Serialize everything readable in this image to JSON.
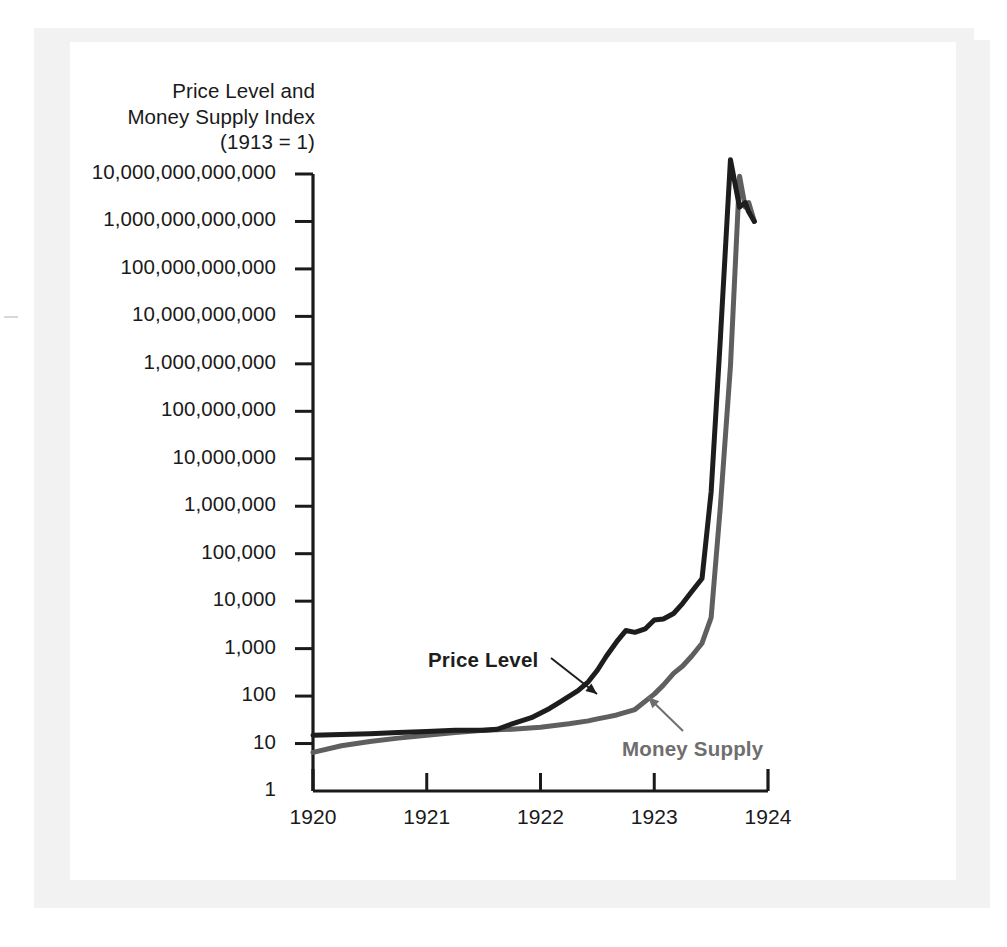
{
  "chart_data": {
    "type": "line",
    "title": "Price Level and Money Supply Index (1913 = 1)",
    "title_lines": [
      "Price Level and",
      "Money Supply Index",
      "(1913 = 1)"
    ],
    "xlabel": "",
    "ylabel": "Price Level and Money Supply Index (1913 = 1)",
    "y_scale": "log",
    "ylim": [
      1,
      10000000000000
    ],
    "xlim": [
      1920,
      1924
    ],
    "grid": false,
    "legend_position": "inline-annotations",
    "ytick_labels": [
      "10,000,000,000,000",
      "1,000,000,000,000",
      "100,000,000,000",
      "10,000,000,000",
      "1,000,000,000",
      "100,000,000",
      "10,000,000",
      "1,000,000",
      "100,000",
      "10,000",
      "1,000",
      "100",
      "10",
      "1"
    ],
    "ytick_values": [
      10000000000000,
      1000000000000,
      100000000000,
      10000000000,
      1000000000,
      100000000,
      10000000,
      1000000,
      100000,
      10000,
      1000,
      100,
      10,
      1
    ],
    "xtick_labels": [
      "1920",
      "1921",
      "1922",
      "1923",
      "1924"
    ],
    "xtick_values": [
      1920,
      1921,
      1922,
      1923,
      1924
    ],
    "series": [
      {
        "name": "Price Level",
        "color": "#1d1d1d",
        "x": [
          1920.0,
          1920.25,
          1920.5,
          1920.75,
          1921.0,
          1921.25,
          1921.5,
          1921.62,
          1921.75,
          1921.92,
          1922.08,
          1922.17,
          1922.33,
          1922.42,
          1922.5,
          1922.58,
          1922.67,
          1922.75,
          1922.83,
          1922.92,
          1923.0,
          1923.08,
          1923.17,
          1923.25,
          1923.33,
          1923.42,
          1923.5,
          1923.58,
          1923.67,
          1923.75,
          1923.8,
          1923.83,
          1923.88
        ],
        "y": [
          15,
          15.5,
          16,
          17,
          18,
          19,
          19,
          20,
          26,
          35,
          55,
          75,
          130,
          200,
          350,
          700,
          1400,
          2400,
          2200,
          2600,
          4000,
          4200,
          5500,
          9000,
          16000,
          30000,
          2000000,
          3000000000,
          20000000000000,
          2000000000000,
          2500000000000,
          1600000000000,
          1000000000000
        ]
      },
      {
        "name": "Money Supply",
        "color": "#5f5f5f",
        "x": [
          1920.0,
          1920.25,
          1920.5,
          1920.75,
          1921.0,
          1921.25,
          1921.5,
          1921.75,
          1922.0,
          1922.25,
          1922.42,
          1922.5,
          1922.58,
          1922.67,
          1922.83,
          1923.0,
          1923.08,
          1923.17,
          1923.25,
          1923.33,
          1923.42,
          1923.5,
          1923.58,
          1923.67,
          1923.75,
          1923.8,
          1923.83,
          1923.88
        ],
        "y": [
          6.5,
          9,
          11,
          13,
          15,
          17,
          19,
          20,
          22,
          26,
          30,
          33,
          36,
          40,
          52,
          110,
          170,
          300,
          430,
          700,
          1300,
          4500,
          900000,
          900000000,
          9000000000000,
          2000000000000,
          2500000000000,
          1000000000000
        ]
      }
    ],
    "annotations": [
      {
        "label": "Price Level",
        "target_series": "Price Level",
        "arrow_direction": "down-right",
        "color": "#1d1d1d"
      },
      {
        "label": "Money Supply",
        "target_series": "Money Supply",
        "arrow_direction": "up-left",
        "color": "#6e6e6e"
      }
    ]
  },
  "colors": {
    "price_level": "#1d1d1d",
    "money_supply": "#5f5f5f",
    "axis": "#1a1a1a",
    "page_background": "#ffffff",
    "scan_edge": "#f2f2f2"
  }
}
